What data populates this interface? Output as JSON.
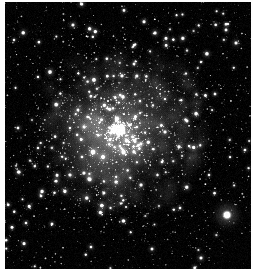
{
  "image": {
    "title": "Globular Cluster Star Field",
    "subject": "globular-cluster",
    "color_mode": "grayscale",
    "width": 253,
    "height": 269,
    "background_color": "#010101",
    "margin_color": "#fdfdfd",
    "star_color": "#ffffff",
    "halo_color": "#b8b8b8",
    "margins": {
      "left": 5,
      "top": 2,
      "right": 2,
      "bottom": 0
    },
    "field": {
      "left": 5,
      "top": 2,
      "width": 246,
      "height": 267
    }
  },
  "chart_data": {
    "type": "scatter",
    "xlabel": "",
    "ylabel": "",
    "xlim": [
      0,
      246
    ],
    "ylim": [
      0,
      267
    ],
    "grid": false,
    "legend": null,
    "cluster_core": {
      "center_x": 116,
      "center_y": 128,
      "glow_radius": 86,
      "core_radius": 52,
      "peak_brightness": 0.46,
      "description": "diffuse unresolved halo glow of the cluster, brightest just left of center"
    },
    "secondary_glow": {
      "center_x": 92,
      "center_y": 150,
      "glow_radius": 48,
      "peak_brightness": 0.3
    },
    "bright_stars": [
      {
        "x": 222,
        "y": 213,
        "r": 5.6,
        "b": 1.0,
        "halo": 19
      },
      {
        "x": 88,
        "y": 150,
        "r": 3.4,
        "b": 0.96,
        "halo": 9
      },
      {
        "x": 98,
        "y": 155,
        "r": 2.9,
        "b": 0.9,
        "halo": 8
      },
      {
        "x": 45,
        "y": 70,
        "r": 2.9,
        "b": 0.92,
        "halo": 8
      },
      {
        "x": 150,
        "y": 31,
        "r": 2.6,
        "b": 0.88,
        "halo": 7
      },
      {
        "x": 231,
        "y": 41,
        "r": 2.5,
        "b": 0.86,
        "halo": 7
      },
      {
        "x": 68,
        "y": 23,
        "r": 2.4,
        "b": 0.85,
        "halo": 7
      },
      {
        "x": 118,
        "y": 95,
        "r": 2.5,
        "b": 0.9,
        "halo": 7
      },
      {
        "x": 160,
        "y": 130,
        "r": 2.4,
        "b": 0.88,
        "halo": 7
      },
      {
        "x": 182,
        "y": 119,
        "r": 2.3,
        "b": 0.86,
        "halo": 6
      },
      {
        "x": 136,
        "y": 183,
        "r": 2.5,
        "b": 0.9,
        "halo": 7
      },
      {
        "x": 111,
        "y": 180,
        "r": 2.4,
        "b": 0.88,
        "halo": 7
      },
      {
        "x": 65,
        "y": 173,
        "r": 2.4,
        "b": 0.87,
        "halo": 7
      },
      {
        "x": 36,
        "y": 194,
        "r": 2.2,
        "b": 0.84,
        "halo": 6
      },
      {
        "x": 21,
        "y": 221,
        "r": 2.1,
        "b": 0.82,
        "halo": 6
      },
      {
        "x": 47,
        "y": 222,
        "r": 2.3,
        "b": 0.85,
        "halo": 6
      },
      {
        "x": 147,
        "y": 247,
        "r": 2.3,
        "b": 0.86,
        "halo": 6
      },
      {
        "x": 196,
        "y": 256,
        "r": 2.4,
        "b": 0.88,
        "halo": 7
      },
      {
        "x": 210,
        "y": 92,
        "r": 2.2,
        "b": 0.83,
        "halo": 6
      },
      {
        "x": 240,
        "y": 148,
        "r": 2.1,
        "b": 0.82,
        "halo": 6
      },
      {
        "x": 13,
        "y": 126,
        "r": 2.2,
        "b": 0.84,
        "halo": 6
      },
      {
        "x": 9,
        "y": 38,
        "r": 2.0,
        "b": 0.8,
        "halo": 5
      },
      {
        "x": 86,
        "y": 245,
        "r": 2.1,
        "b": 0.82,
        "halo": 6
      },
      {
        "x": 175,
        "y": 206,
        "r": 2.1,
        "b": 0.82,
        "halo": 6
      },
      {
        "x": 129,
        "y": 62,
        "r": 2.2,
        "b": 0.84,
        "halo": 6
      },
      {
        "x": 196,
        "y": 60,
        "r": 2.0,
        "b": 0.8,
        "halo": 5
      },
      {
        "x": 73,
        "y": 108,
        "r": 2.2,
        "b": 0.85,
        "halo": 6
      },
      {
        "x": 157,
        "y": 160,
        "r": 2.1,
        "b": 0.83,
        "halo": 6
      },
      {
        "x": 204,
        "y": 173,
        "r": 2.0,
        "b": 0.8,
        "halo": 5
      },
      {
        "x": 33,
        "y": 146,
        "r": 2.0,
        "b": 0.8,
        "halo": 5
      }
    ],
    "field_star_count": 2100,
    "cluster_star_count": 1500
  }
}
